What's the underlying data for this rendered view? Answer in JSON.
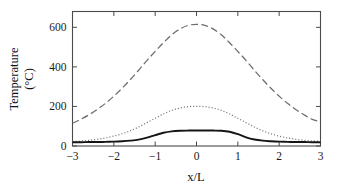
{
  "chart_data": {
    "type": "line",
    "title": "",
    "xlabel": "x/L",
    "ylabel": "Temperature (°C)",
    "ylabel_line1": "Temperature",
    "ylabel_line2": "(°C)",
    "xlim": [
      -3,
      3
    ],
    "ylim": [
      0,
      680
    ],
    "grid": false,
    "legend": "none",
    "xticks": [
      -3,
      -2,
      -1,
      0,
      1,
      2,
      3
    ],
    "xticklabels": [
      "−3",
      "−2",
      "−1",
      "0",
      "1",
      "2",
      "3"
    ],
    "yticks": [
      0,
      200,
      400,
      600
    ],
    "yticklabels": [
      "0",
      "200",
      "400",
      "600"
    ],
    "x": [
      -3,
      -2.8,
      -2.6,
      -2.4,
      -2.2,
      -2,
      -1.8,
      -1.6,
      -1.4,
      -1.2,
      -1,
      -0.8,
      -0.6,
      -0.4,
      -0.2,
      0,
      0.2,
      0.4,
      0.6,
      0.8,
      1,
      1.2,
      1.4,
      1.6,
      1.8,
      2,
      2.2,
      2.4,
      2.6,
      2.8,
      3
    ],
    "series": [
      {
        "name": "long-dashed-curve",
        "style": "dashed",
        "color": "#6d6d6d",
        "peak": 615,
        "values": [
          115,
          135,
          158,
          185,
          216,
          252,
          292,
          336,
          383,
          432,
          478,
          522,
          562,
          592,
          610,
          615,
          610,
          592,
          562,
          522,
          478,
          432,
          383,
          336,
          292,
          252,
          216,
          185,
          158,
          135,
          123
        ]
      },
      {
        "name": "dotted-curve",
        "style": "dotted",
        "color": "#7a7a7a",
        "peak": 200,
        "values": [
          22,
          25,
          29,
          34,
          41,
          50,
          62,
          77,
          96,
          118,
          140,
          162,
          180,
          192,
          199,
          200,
          199,
          192,
          180,
          162,
          140,
          118,
          96,
          77,
          62,
          50,
          41,
          34,
          29,
          26,
          24
        ]
      },
      {
        "name": "solid-curve",
        "style": "solid",
        "color": "#141414",
        "peak": 78,
        "values": [
          19,
          19,
          20,
          20,
          21,
          22,
          24,
          27,
          32,
          42,
          55,
          67,
          74,
          77,
          78,
          78,
          78,
          78,
          77,
          72,
          60,
          44,
          33,
          27,
          24,
          22,
          21,
          20,
          20,
          19,
          19
        ]
      }
    ]
  }
}
